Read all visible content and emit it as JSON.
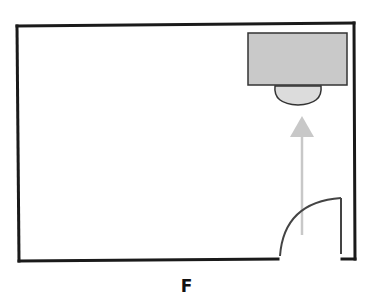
{
  "figure": {
    "caption": "F"
  },
  "colors": {
    "wall": "#1a1a1a",
    "desk_fill": "#c9c9c9",
    "desk_stroke": "#333333",
    "chair_fill": "#dcdcdc",
    "arrow": "#c8c8c8",
    "door": "#444444",
    "background": "#ffffff"
  },
  "room": {
    "x": 17,
    "y": 24,
    "width": 337,
    "height": 237
  },
  "door": {
    "gap_start_x": 279,
    "gap_end_x": 341,
    "leaf_top_y": 198
  },
  "desk": {
    "x": 248,
    "y": 33,
    "width": 99,
    "height": 52
  },
  "chair": {
    "cx": 298,
    "top_y": 85,
    "rx": 24,
    "ry": 20
  },
  "arrow": {
    "x": 302,
    "tip_y": 116,
    "base_y": 236
  }
}
